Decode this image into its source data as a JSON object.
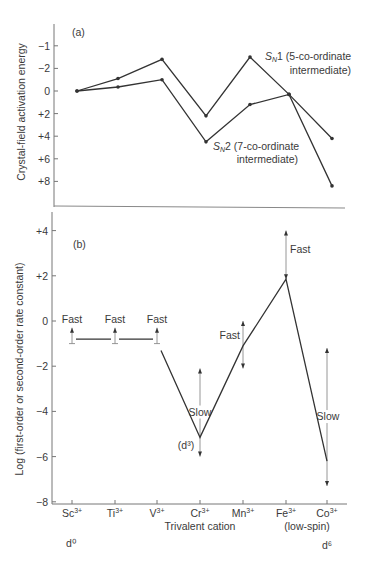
{
  "chart_data": [
    {
      "panel": "(a)",
      "type": "line",
      "title": "",
      "xlabel": "",
      "ylabel": "Crystal-field activation energy",
      "y_ticks": [
        "−1",
        "−2",
        "0",
        "+2",
        "+4",
        "+6",
        "+8"
      ],
      "y_tick_values": [
        -4,
        -2,
        0,
        2,
        4,
        6,
        8
      ],
      "ylim": [
        -4.7,
        10.5
      ],
      "y_inverted": true,
      "grid": false,
      "categories": [
        "Sc3+",
        "Ti3+",
        "V3+",
        "Cr3+",
        "Mn3+",
        "Fe3+",
        "Co3+"
      ],
      "series": [
        {
          "name": "SN1 (5-co-ordinate intermediate)",
          "label_main": "1 (5-co-ordinate",
          "label_sub": "intermediate)",
          "values": [
            0,
            -1.1,
            -2.8,
            2.2,
            -3.0,
            0.3,
            4.2
          ]
        },
        {
          "name": "SN2 (7-co-ordinate intermediate)",
          "label_main": "2 (7-co-ordinate",
          "label_sub": "intermediate)",
          "values": [
            0,
            -0.35,
            -1.0,
            4.5,
            1.2,
            0.3,
            8.4
          ]
        }
      ]
    },
    {
      "panel": "(b)",
      "type": "line",
      "title": "",
      "xlabel": "Trivalent cation",
      "ylabel": "Log (first-order or second-order rate constant)",
      "y_ticks": [
        "+4",
        "+2",
        "0",
        "−2",
        "−4",
        "−6",
        "−8"
      ],
      "y_tick_values": [
        4,
        2,
        0,
        -2,
        -4,
        -6,
        -8
      ],
      "ylim": [
        -8,
        4.9
      ],
      "grid": false,
      "categories": [
        "Sc3+",
        "Ti3+",
        "V3+",
        "Cr3+",
        "Mn3+",
        "Fe3+",
        "Co3+"
      ],
      "category_labels": [
        {
          "base": "Sc",
          "sup": "3+"
        },
        {
          "base": "Ti",
          "sup": "3+"
        },
        {
          "base": "V",
          "sup": "3+"
        },
        {
          "base": "Cr",
          "sup": "3+"
        },
        {
          "base": "Mn",
          "sup": "3+"
        },
        {
          "base": "Fe",
          "sup": "3+"
        },
        {
          "base": "Co",
          "sup": "3+"
        }
      ],
      "series": [
        {
          "name": "log k",
          "values": [
            -0.8,
            -0.8,
            -0.8,
            -5.15,
            -1.1,
            1.85,
            -6.2
          ]
        }
      ],
      "annotations": [
        {
          "cation": "Sc3+",
          "text": "Fast",
          "range": [
            -1.0,
            -0.3
          ]
        },
        {
          "cation": "Ti3+",
          "text": "Fast",
          "range": [
            -1.0,
            -0.3
          ]
        },
        {
          "cation": "V3+",
          "text": "Fast",
          "range": [
            -1.0,
            -0.3
          ]
        },
        {
          "cation": "Cr3+",
          "text": "Slow",
          "range": [
            -6.0,
            -2.1
          ],
          "extra": "(d³)"
        },
        {
          "cation": "Mn3+",
          "text": "Fast",
          "range": [
            -2.1,
            0.0
          ]
        },
        {
          "cation": "Fe3+",
          "text": "Fast",
          "range": [
            1.85,
            4.0
          ]
        },
        {
          "cation": "Co3+",
          "text": "Slow",
          "range": [
            -7.3,
            -1.2
          ]
        }
      ],
      "under_labels": {
        "d0": "d⁰",
        "d6": "d⁶",
        "low_spin": "(low-spin)"
      }
    }
  ],
  "figure": {
    "panel_a_label": "(a)",
    "panel_b_label": "(b)",
    "sn_prefix": "S",
    "sn_sub": "N",
    "colors": {
      "line": "#333333",
      "arrow": "#8a8a8a",
      "text": "#3a3a3a",
      "axis": "#777777"
    }
  }
}
